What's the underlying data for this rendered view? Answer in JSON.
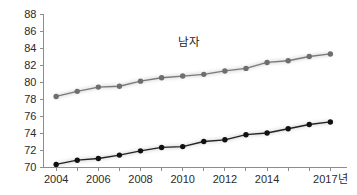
{
  "chart_data": {
    "type": "line",
    "title": "",
    "subtitle": "",
    "xlabel": "",
    "ylabel": "",
    "x": [
      2004,
      2005,
      2006,
      2007,
      2008,
      2009,
      2010,
      2011,
      2012,
      2013,
      2014,
      2015,
      2016,
      2017
    ],
    "categories": [
      "2004",
      "2005",
      "2006",
      "2007",
      "2008",
      "2009",
      "2010",
      "2011",
      "2012",
      "2013",
      "2014",
      "2015",
      "2016",
      "2017"
    ],
    "xlim": [
      2003.4,
      2017.6
    ],
    "ylim": [
      70,
      88
    ],
    "y_ticks": [
      70,
      72,
      74,
      76,
      78,
      80,
      82,
      84,
      86,
      88
    ],
    "y_tick_labels": [
      "70",
      "72",
      "74",
      "76",
      "78",
      "80",
      "82",
      "84",
      "86",
      "88"
    ],
    "x_ticks": [
      2004,
      2005,
      2006,
      2007,
      2008,
      2009,
      2010,
      2011,
      2012,
      2013,
      2014,
      2015,
      2016,
      2017
    ],
    "x_tick_labels": [
      "2004",
      "",
      "2006",
      "",
      "2008",
      "",
      "2010",
      "",
      "2012",
      "",
      "2014",
      "",
      "",
      "2017년"
    ],
    "grid": false,
    "legend": "none",
    "annotations": [
      {
        "text": "남자",
        "x": 2010.3,
        "y": 84.2
      }
    ],
    "series": [
      {
        "name": "남자",
        "label": "남자",
        "color": "#7a7a7a",
        "marker_color": "#6e6e6e",
        "values": [
          78.3,
          78.9,
          79.4,
          79.5,
          80.1,
          80.5,
          80.7,
          80.9,
          81.3,
          81.6,
          82.3,
          82.5,
          83.0,
          83.3
        ]
      },
      {
        "name": "series-2",
        "label": "",
        "color": "#222222",
        "marker_color": "#111111",
        "values": [
          70.3,
          70.8,
          71.0,
          71.4,
          71.9,
          72.3,
          72.4,
          73.0,
          73.2,
          73.8,
          74.0,
          74.5,
          75.0,
          75.3
        ]
      }
    ]
  }
}
